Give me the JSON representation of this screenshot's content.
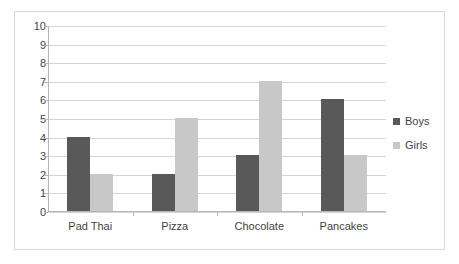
{
  "chart_data": {
    "type": "bar",
    "title": "",
    "subtitle": "",
    "xlabel": "",
    "ylabel": "",
    "categories": [
      "Pad Thai",
      "Pizza",
      "Chocolate",
      "Pancakes"
    ],
    "series": [
      {
        "name": "Boys",
        "color": "#595959",
        "values": [
          4,
          2,
          3,
          6
        ]
      },
      {
        "name": "Girls",
        "color": "#c8c8c8",
        "values": [
          2,
          5,
          7,
          3
        ]
      }
    ],
    "ylim": [
      0,
      10
    ],
    "y_ticks": [
      0,
      1,
      2,
      3,
      4,
      5,
      6,
      7,
      8,
      9,
      10
    ],
    "y_tick_labels": [
      "0",
      "1",
      "2",
      "3",
      "4",
      "5",
      "6",
      "7",
      "8",
      "9",
      "10"
    ],
    "grid": true,
    "grid_axis": "y",
    "legend_position": "right",
    "plot_background": "#ffffff",
    "grid_color": "#d4d4d4",
    "axis_color": "#b7b7b7",
    "border_color": "#d9d9d9"
  }
}
